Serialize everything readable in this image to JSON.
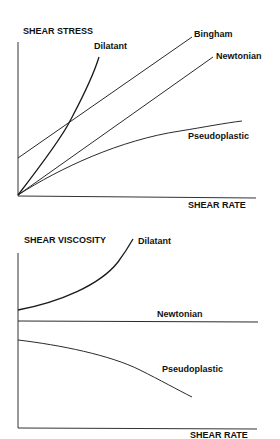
{
  "top_chart": {
    "y_axis_title": "SHEAR STRESS",
    "x_axis_title": "SHEAR RATE",
    "curves": {
      "dilatant": "Dilatant",
      "bingham": "Bingham",
      "newtonian": "Newtonian",
      "pseudoplastic": "Pseudoplastic"
    }
  },
  "bottom_chart": {
    "y_axis_title": "SHEAR VISCOSITY",
    "x_axis_title": "SHEAR RATE",
    "curves": {
      "dilatant": "Dilatant",
      "newtonian": "Newtonian",
      "pseudoplastic": "Pseudoplastic"
    }
  },
  "colors": {
    "line": "#2a2a2a",
    "text": "#111111",
    "background": "#ffffff"
  }
}
